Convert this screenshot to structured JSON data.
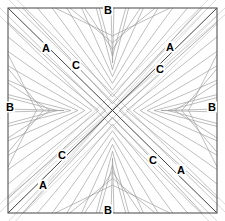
{
  "figure": {
    "type": "geometric-line-diagram",
    "canvas": {
      "width": 225,
      "height": 221
    },
    "colors": {
      "background": "#ffffff",
      "border": "#555555",
      "diagonal": "#444444",
      "nested_line": "#9a9a9a",
      "faint_line": "#c8c8c8",
      "label_text": "#000000"
    },
    "square": {
      "left": 8,
      "top": 8,
      "right": 217,
      "bottom": 213,
      "stroke_width": 1.1
    },
    "diagonals": [
      {
        "name": "main-diagonal-tl-br",
        "from": [
          8,
          8
        ],
        "to": [
          217,
          213
        ]
      },
      {
        "name": "anti-diagonal-tr-bl",
        "from": [
          217,
          8
        ],
        "to": [
          8,
          213
        ]
      }
    ],
    "nested_triangle_families": [
      {
        "name": "top-family",
        "side": "top",
        "count": 11,
        "apex": [
          112.5,
          110.5
        ]
      },
      {
        "name": "right-family",
        "side": "right",
        "count": 11,
        "apex": [
          112.5,
          110.5
        ]
      },
      {
        "name": "bottom-family",
        "side": "bottom",
        "count": 11,
        "apex": [
          112.5,
          110.5
        ]
      },
      {
        "name": "left-family",
        "side": "left",
        "count": 11,
        "apex": [
          112.5,
          110.5
        ]
      }
    ],
    "faint_parallel_families": [
      {
        "name": "faint-parallel-main-diagonal",
        "count": 3,
        "direction": "tl-br"
      },
      {
        "name": "faint-parallel-anti-diagonal",
        "count": 3,
        "direction": "tr-bl"
      }
    ],
    "labels": [
      {
        "id": "label-b-top",
        "text": "B",
        "x": 108,
        "y": 10
      },
      {
        "id": "label-b-bottom",
        "text": "B",
        "x": 108,
        "y": 210
      },
      {
        "id": "label-b-left",
        "text": "B",
        "x": 10,
        "y": 107
      },
      {
        "id": "label-b-right",
        "text": "B",
        "x": 212,
        "y": 107
      },
      {
        "id": "label-a-top-left",
        "text": "A",
        "x": 46,
        "y": 48
      },
      {
        "id": "label-a-top-right",
        "text": "A",
        "x": 170,
        "y": 47
      },
      {
        "id": "label-a-bottom-left",
        "text": "A",
        "x": 43,
        "y": 185
      },
      {
        "id": "label-a-bottom-right",
        "text": "A",
        "x": 181,
        "y": 170
      },
      {
        "id": "label-c-top-left",
        "text": "C",
        "x": 76,
        "y": 65
      },
      {
        "id": "label-c-top-right",
        "text": "C",
        "x": 160,
        "y": 69
      },
      {
        "id": "label-c-bottom-left",
        "text": "C",
        "x": 62,
        "y": 155
      },
      {
        "id": "label-c-bottom-right",
        "text": "C",
        "x": 153,
        "y": 160
      }
    ]
  }
}
